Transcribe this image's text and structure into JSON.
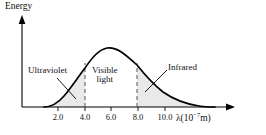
{
  "figure": {
    "title_y": "Energy",
    "axis_x_label_prefix": "λ(10",
    "axis_x_label_exp": "−7",
    "axis_x_label_suffix": "m)",
    "x_ticks": [
      {
        "value": "2.0",
        "px": 58
      },
      {
        "value": "4.0",
        "px": 85
      },
      {
        "value": "6.0",
        "px": 111
      },
      {
        "value": "8.0",
        "px": 138
      },
      {
        "value": "10.0",
        "px": 165
      }
    ],
    "regions": [
      {
        "id": "ultraviolet",
        "label": "Ultraviolet"
      },
      {
        "id": "visible",
        "label_line1": "Visible",
        "label_line2": "light"
      },
      {
        "id": "infrared",
        "label": "Infrared"
      }
    ],
    "colors": {
      "curve": "#000000",
      "axis": "#000000",
      "shade": "#e9e9e9",
      "dashed": "#555555",
      "text": "#111111"
    }
  },
  "chart_data": {
    "type": "line",
    "title": "",
    "xlabel": "λ(10⁻⁷ m)",
    "ylabel": "Energy",
    "xlim": [
      0,
      12.8
    ],
    "ylim": [
      0,
      1.12
    ],
    "grid": false,
    "legend": null,
    "annotations": [
      {
        "text": "Ultraviolet",
        "region_x": [
          0,
          4.0
        ],
        "shaded": true
      },
      {
        "text": "Visible light",
        "region_x": [
          4.0,
          7.0
        ],
        "shaded": false
      },
      {
        "text": "Infrared",
        "region_x": [
          7.0,
          12.0
        ],
        "shaded": true
      }
    ],
    "markers": {
      "dashed_vertical_lines_x": [
        4.0,
        7.0
      ],
      "peak_x": 5.1,
      "peak_y": 1.0
    },
    "series": [
      {
        "name": "Blackbody spectral energy",
        "x": [
          1.0,
          1.4,
          1.8,
          2.2,
          2.6,
          3.0,
          3.4,
          3.8,
          4.2,
          4.6,
          5.1,
          5.6,
          6.0,
          6.5,
          7.0,
          7.5,
          8.0,
          8.6,
          9.2,
          9.8,
          10.4,
          11.0,
          11.6,
          12.2
        ],
        "y": [
          0.0,
          0.02,
          0.05,
          0.1,
          0.18,
          0.3,
          0.45,
          0.63,
          0.8,
          0.93,
          1.0,
          0.97,
          0.91,
          0.8,
          0.68,
          0.56,
          0.45,
          0.34,
          0.25,
          0.18,
          0.12,
          0.08,
          0.05,
          0.03
        ]
      }
    ]
  }
}
